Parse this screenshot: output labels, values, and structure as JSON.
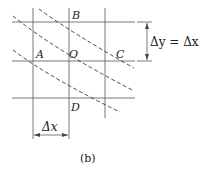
{
  "diagram": {
    "points": {
      "A": "A",
      "B": "B",
      "C": "C",
      "D": "D",
      "O": "O"
    },
    "dimension_x": "Δx",
    "dimension_y_equation": "Δy = Δx",
    "caption": "(b)"
  }
}
